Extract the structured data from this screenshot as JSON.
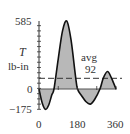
{
  "chart_data": {
    "type": "area",
    "title": "",
    "xlabel": "",
    "ylabel": "T lb-in",
    "ylabel_symbol": "T",
    "ylabel_unit": "lb-in",
    "x_ticks": [
      0,
      180,
      360
    ],
    "y_ticks": [
      -175,
      0,
      585
    ],
    "xlim": [
      0,
      360
    ],
    "ylim": [
      -175,
      585
    ],
    "grid": false,
    "series": [
      {
        "name": "Torque",
        "x": [
          0,
          15,
          30,
          45,
          60,
          70,
          90,
          110,
          130,
          150,
          170,
          180,
          200,
          220,
          240,
          260,
          285,
          300,
          320,
          340,
          360
        ],
        "values": [
          0,
          -120,
          -175,
          -140,
          -50,
          0,
          260,
          500,
          585,
          420,
          120,
          0,
          -60,
          -110,
          -130,
          -90,
          0,
          90,
          150,
          90,
          0
        ],
        "fill_to_zero": true,
        "fill_color": "#b8b8b8",
        "line_color": "#111111"
      }
    ],
    "annotations": [
      {
        "text": "avg",
        "value": 92,
        "label": "92",
        "style": "dashed horizontal line"
      }
    ]
  },
  "labels": {
    "y_top": "585",
    "y_zero": "0",
    "y_bottom": "−175",
    "y_symbol": "T",
    "y_unit": "lb-in",
    "x_0": "0",
    "x_180": "180",
    "x_360": "360",
    "avg_text": "avg",
    "avg_value": "92"
  }
}
